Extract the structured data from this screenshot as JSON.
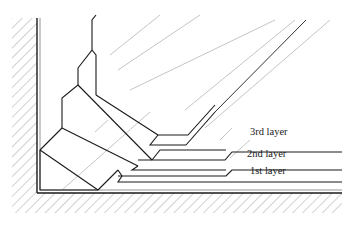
{
  "diagram": {
    "type": "layered corner cross-section",
    "labels": {
      "layer3": "3rd layer",
      "layer2": "2nd layer",
      "layer1": "1st layer"
    },
    "colors": {
      "line": "#1a1a1a",
      "hatch": "#9a9a9a",
      "guide": "#bdbdbd",
      "background": "#ffffff"
    }
  }
}
